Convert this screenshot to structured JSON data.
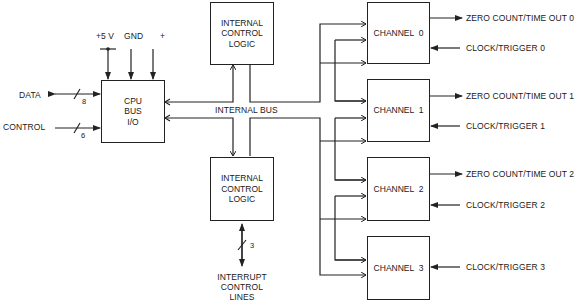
{
  "blocks": {
    "cpu_bus_io": {
      "label_lines": [
        "CPU",
        "BUS",
        "I/O"
      ]
    },
    "icl_top": {
      "label_lines": [
        "INTERNAL",
        "CONTROL",
        "LOGIC"
      ]
    },
    "icl_bottom": {
      "label_lines": [
        "INTERNAL",
        "CONTROL",
        "LOGIC"
      ]
    },
    "channels": [
      {
        "label": "CHANNEL  0",
        "output": "ZERO COUNT/TIME OUT 0",
        "input": "CLOCK/TRIGGER 0"
      },
      {
        "label": "CHANNEL  1",
        "output": "ZERO COUNT/TIME OUT 1",
        "input": "CLOCK/TRIGGER 1"
      },
      {
        "label": "CHANNEL  2",
        "output": "ZERO COUNT/TIME OUT 2",
        "input": "CLOCK/TRIGGER 2"
      },
      {
        "label": "CHANNEL  3",
        "output": "",
        "input": "CLOCK/TRIGGER 3"
      }
    ]
  },
  "signals": {
    "power": [
      "+5 V",
      "GND",
      "+"
    ],
    "data": {
      "label": "DATA",
      "width": "8"
    },
    "control": {
      "label": "CONTROL",
      "width": "6"
    },
    "internal_bus": "INTERNAL BUS",
    "interrupt": {
      "width": "3",
      "label_lines": [
        "INTERRUPT",
        "CONTROL",
        "LINES"
      ]
    }
  }
}
